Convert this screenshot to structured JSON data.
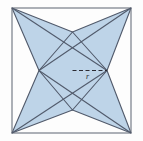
{
  "figure": {
    "type": "geometry-diagram",
    "canvas": {
      "width": 143,
      "height": 141,
      "background": "#fdfdfd"
    },
    "colors": {
      "fill": "#bed4e8",
      "stroke": "#515a6b",
      "frame_stroke": "#6b727e",
      "dash_stroke": "#2b2b33",
      "label_color": "#2b2b33",
      "background": "#fdfdfd"
    },
    "square": {
      "name": "outer-square",
      "left": 12,
      "top": 8,
      "right": 131,
      "bottom": 133,
      "stroke_width": 1.1
    },
    "star": {
      "name": "four-pointed-star",
      "points": "12,8 72.5,32 131,8 107,70.5 131,133 72.5,110 12,133 39,70.5",
      "fill": "#bed4e8",
      "stroke": "#515a6b",
      "stroke_width": 1.1
    },
    "diamond": {
      "name": "inner-diamond",
      "points": "72.5,32 107,70.5 72.5,110 39,70.5",
      "stroke": "#515a6b",
      "stroke_width": 1.1
    },
    "diagonals": [
      {
        "name": "diagonal-top-left-to-bottom-right",
        "x1": 12,
        "y1": 8,
        "x2": 107,
        "y2": 70.5
      },
      {
        "name": "diagonal-top-right-to-bottom-left",
        "x1": 131,
        "y1": 8,
        "x2": 39,
        "y2": 70.5
      },
      {
        "name": "diagonal-bottom-left-to-top-right",
        "x1": 12,
        "y1": 133,
        "x2": 107,
        "y2": 70.5
      },
      {
        "name": "diagonal-bottom-right-to-top-left",
        "x1": 131,
        "y1": 133,
        "x2": 39,
        "y2": 70.5
      }
    ],
    "radius_line": {
      "name": "radius-dashed-line",
      "x1": 72.5,
      "y1": 70.5,
      "x2": 107,
      "y2": 70.5,
      "dash_pattern": "4,2.5",
      "stroke": "#2b2b33",
      "stroke_width": 1.2
    },
    "labels": [
      {
        "name": "radius-label",
        "text": "r",
        "x": 86,
        "y": 73
      }
    ]
  }
}
